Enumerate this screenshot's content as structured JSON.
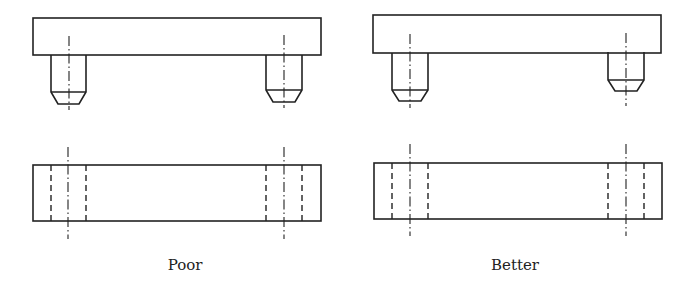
{
  "figure": {
    "panels": [
      {
        "id": "poor",
        "caption": "Poor",
        "caption_x": 185,
        "front_view": {
          "plate": {
            "x": 33,
            "y": 18,
            "w": 288,
            "h": 37
          },
          "pins": [
            {
              "x": 51,
              "w": 35,
              "top": 55,
              "chamfer_start": 92,
              "bottom": 104,
              "chamfer_inset": 7
            },
            {
              "x": 266,
              "w": 36,
              "top": 55,
              "chamfer_start": 90,
              "bottom": 102,
              "chamfer_inset": 7
            }
          ],
          "centerlines": [
            {
              "x": 69,
              "y1": 36,
              "y2": 110
            },
            {
              "x": 284,
              "y1": 35,
              "y2": 108
            }
          ]
        },
        "top_view": {
          "plate": {
            "x": 33,
            "y": 165,
            "w": 288,
            "h": 56
          },
          "holes": [
            {
              "x1": 51,
              "x2": 86,
              "center": 68
            },
            {
              "x1": 266,
              "x2": 302,
              "center": 284
            }
          ],
          "centerline_y1": 147,
          "centerline_y2": 239
        }
      },
      {
        "id": "better",
        "caption": "Better",
        "caption_x": 515,
        "front_view": {
          "plate": {
            "x": 373,
            "y": 15,
            "w": 288,
            "h": 38
          },
          "pins": [
            {
              "x": 392,
              "w": 36,
              "top": 53,
              "chamfer_start": 90,
              "bottom": 101,
              "chamfer_inset": 7
            },
            {
              "x": 608,
              "w": 36,
              "top": 52,
              "chamfer_start": 80,
              "bottom": 91,
              "chamfer_inset": 7
            }
          ],
          "centerlines": [
            {
              "x": 410,
              "y1": 34,
              "y2": 108
            },
            {
              "x": 626,
              "y1": 33,
              "y2": 106
            }
          ]
        },
        "top_view": {
          "plate": {
            "x": 374,
            "y": 163,
            "w": 288,
            "h": 56
          },
          "holes": [
            {
              "x1": 392,
              "x2": 428,
              "center": 410
            },
            {
              "x1": 608,
              "x2": 644,
              "center": 626
            }
          ],
          "centerline_y1": 144,
          "centerline_y2": 236
        }
      }
    ]
  }
}
